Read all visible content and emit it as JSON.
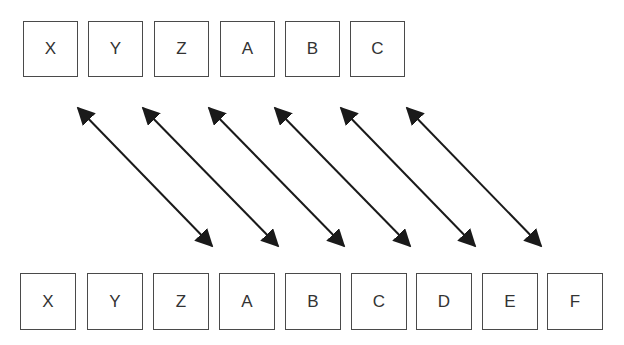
{
  "top_row": {
    "boxes": [
      {
        "label": "X",
        "x": 23
      },
      {
        "label": "Y",
        "x": 88
      },
      {
        "label": "Z",
        "x": 154
      },
      {
        "label": "A",
        "x": 220
      },
      {
        "label": "B",
        "x": 285
      },
      {
        "label": "C",
        "x": 350
      }
    ]
  },
  "bottom_row": {
    "boxes": [
      {
        "label": "X",
        "x": 22
      },
      {
        "label": "Y",
        "x": 88
      },
      {
        "label": "Z",
        "x": 153
      },
      {
        "label": "A",
        "x": 219
      },
      {
        "label": "B",
        "x": 286
      },
      {
        "label": "C",
        "x": 352
      },
      {
        "label": "D",
        "x": 417
      },
      {
        "label": "E",
        "x": 482
      },
      {
        "label": "F",
        "x": 548
      }
    ]
  },
  "arrows": [
    {
      "from": "X",
      "to": "C"
    },
    {
      "from": "Y",
      "to": "D"
    },
    {
      "from": "Z",
      "to": "E"
    },
    {
      "from": "A",
      "to": "F"
    },
    {
      "from": "B",
      "to": "G"
    },
    {
      "from": "C",
      "to": "H"
    }
  ],
  "colors": {
    "stroke": "#1a1a1a",
    "box_border": "#4a4a4a",
    "text": "#333333"
  }
}
